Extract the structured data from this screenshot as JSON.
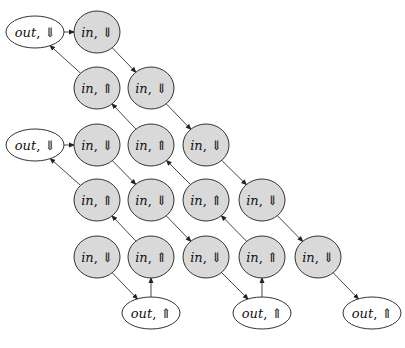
{
  "diagram": {
    "title": "",
    "arrow_symbols": {
      "down": "⇓",
      "up": "⇑"
    },
    "colors": {
      "in_fill": "#d9d9d9",
      "out_fill": "#ffffff",
      "stroke": "#333333"
    },
    "nodes": [
      {
        "id": "n1",
        "kind": "out",
        "dir": "down",
        "label": "out",
        "arrow": "⇓",
        "x": 35,
        "y": 32
      },
      {
        "id": "n2",
        "kind": "in",
        "dir": "down",
        "label": "in",
        "arrow": "⇓",
        "x": 97,
        "y": 32
      },
      {
        "id": "n3",
        "kind": "in",
        "dir": "up",
        "label": "in",
        "arrow": "⇑",
        "x": 97,
        "y": 88
      },
      {
        "id": "n4",
        "kind": "in",
        "dir": "down",
        "label": "in",
        "arrow": "⇓",
        "x": 151,
        "y": 88
      },
      {
        "id": "n5",
        "kind": "out",
        "dir": "down",
        "label": "out",
        "arrow": "⇓",
        "x": 35,
        "y": 145
      },
      {
        "id": "n6",
        "kind": "in",
        "dir": "down",
        "label": "in",
        "arrow": "⇓",
        "x": 97,
        "y": 145
      },
      {
        "id": "n7",
        "kind": "in",
        "dir": "up",
        "label": "in",
        "arrow": "⇑",
        "x": 151,
        "y": 145
      },
      {
        "id": "n8",
        "kind": "in",
        "dir": "down",
        "label": "in",
        "arrow": "⇓",
        "x": 206,
        "y": 145
      },
      {
        "id": "n9",
        "kind": "in",
        "dir": "up",
        "label": "in",
        "arrow": "⇑",
        "x": 97,
        "y": 200
      },
      {
        "id": "n10",
        "kind": "in",
        "dir": "down",
        "label": "in",
        "arrow": "⇓",
        "x": 151,
        "y": 200
      },
      {
        "id": "n11",
        "kind": "in",
        "dir": "up",
        "label": "in",
        "arrow": "⇑",
        "x": 206,
        "y": 200
      },
      {
        "id": "n12",
        "kind": "in",
        "dir": "down",
        "label": "in",
        "arrow": "⇓",
        "x": 262,
        "y": 200
      },
      {
        "id": "n13",
        "kind": "in",
        "dir": "down",
        "label": "in",
        "arrow": "⇓",
        "x": 97,
        "y": 257
      },
      {
        "id": "n14",
        "kind": "in",
        "dir": "up",
        "label": "in",
        "arrow": "⇑",
        "x": 151,
        "y": 257
      },
      {
        "id": "n15",
        "kind": "in",
        "dir": "down",
        "label": "in",
        "arrow": "⇓",
        "x": 206,
        "y": 257
      },
      {
        "id": "n16",
        "kind": "in",
        "dir": "up",
        "label": "in",
        "arrow": "⇑",
        "x": 262,
        "y": 257
      },
      {
        "id": "n17",
        "kind": "in",
        "dir": "down",
        "label": "in",
        "arrow": "⇓",
        "x": 318,
        "y": 257
      },
      {
        "id": "n18",
        "kind": "out",
        "dir": "up",
        "label": "out",
        "arrow": "⇑",
        "x": 151,
        "y": 313
      },
      {
        "id": "n19",
        "kind": "out",
        "dir": "up",
        "label": "out",
        "arrow": "⇑",
        "x": 262,
        "y": 313
      },
      {
        "id": "n20",
        "kind": "out",
        "dir": "up",
        "label": "out",
        "arrow": "⇑",
        "x": 372,
        "y": 313
      }
    ],
    "edges": [
      {
        "from": "n1",
        "to": "n2"
      },
      {
        "from": "n2",
        "to": "n4"
      },
      {
        "from": "n3",
        "to": "n1"
      },
      {
        "from": "n4",
        "to": "n8"
      },
      {
        "from": "n7",
        "to": "n3"
      },
      {
        "from": "n5",
        "to": "n6"
      },
      {
        "from": "n6",
        "to": "n10"
      },
      {
        "from": "n9",
        "to": "n5"
      },
      {
        "from": "n8",
        "to": "n12"
      },
      {
        "from": "n11",
        "to": "n7"
      },
      {
        "from": "n10",
        "to": "n15"
      },
      {
        "from": "n14",
        "to": "n9"
      },
      {
        "from": "n12",
        "to": "n17"
      },
      {
        "from": "n16",
        "to": "n11"
      },
      {
        "from": "n13",
        "to": "n18"
      },
      {
        "from": "n18",
        "to": "n14"
      },
      {
        "from": "n15",
        "to": "n19"
      },
      {
        "from": "n19",
        "to": "n16"
      },
      {
        "from": "n17",
        "to": "n20"
      }
    ]
  }
}
